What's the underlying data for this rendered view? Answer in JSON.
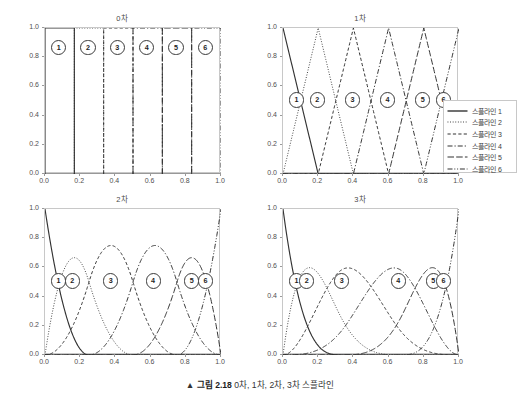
{
  "figure": {
    "caption_marker": "▲",
    "caption_label": "그림 2.18",
    "caption_text": "0차, 1차, 2차, 3차 스플라인"
  },
  "panels": [
    {
      "title": "0차",
      "degree": 0
    },
    {
      "title": "1차",
      "degree": 1
    },
    {
      "title": "2차",
      "degree": 2
    },
    {
      "title": "3차",
      "degree": 3
    }
  ],
  "axes": {
    "xticks": [
      "0.0",
      "0.2",
      "0.4",
      "0.6",
      "0.8",
      "1.0"
    ],
    "xtick_values": [
      0.0,
      0.2,
      0.4,
      0.6,
      0.8,
      1.0
    ],
    "yticks": [
      "0.0",
      "0.2",
      "0.4",
      "0.6",
      "0.8",
      "1.0"
    ],
    "ytick_values": [
      0.0,
      0.2,
      0.4,
      0.6,
      0.8,
      1.0
    ],
    "xlim": [
      0.0,
      1.0
    ],
    "ylim": [
      0.0,
      1.0
    ],
    "grid": false
  },
  "markers": [
    "1",
    "2",
    "3",
    "4",
    "5",
    "6"
  ],
  "legend": {
    "position": "right",
    "items": [
      {
        "label": "스플라인 1",
        "style": "solid"
      },
      {
        "label": "스플라인 2",
        "style": "dotted"
      },
      {
        "label": "스플라인 3",
        "style": "dashed"
      },
      {
        "label": "스플라인 4",
        "style": "dashdot"
      },
      {
        "label": "스플라인 5",
        "style": "longdash"
      },
      {
        "label": "스플라인 6",
        "style": "dashdotdot"
      }
    ]
  },
  "colors": {
    "line": "#333333",
    "axis": "#c8c8c8",
    "text": "#3a3a3a",
    "background": "#ffffff"
  },
  "chart_data": {
    "type": "line",
    "title": "0차, 1차, 2차, 3차 스플라인",
    "xlabel": "",
    "ylabel": "",
    "xlim": [
      0.0,
      1.0
    ],
    "ylim": [
      0.0,
      1.0
    ],
    "grid": false,
    "legend_position": "right",
    "subplots": [
      {
        "title": "0차",
        "degree": 0,
        "description": "Piecewise-constant (box) B-spline basis: each spline equals 1.0 on its own interval and 0.0 elsewhere.",
        "knots": [
          0.0,
          0.1667,
          0.3333,
          0.5,
          0.6667,
          0.8333,
          1.0
        ],
        "series": [
          {
            "name": "스플라인 1",
            "style": "solid",
            "support": [
              0.0,
              0.1667
            ],
            "peak_x": 0.0833,
            "peak_y": 1.0
          },
          {
            "name": "스플라인 2",
            "style": "dotted",
            "support": [
              0.1667,
              0.3333
            ],
            "peak_x": 0.25,
            "peak_y": 1.0
          },
          {
            "name": "스플라인 3",
            "style": "dashed",
            "support": [
              0.3333,
              0.5
            ],
            "peak_x": 0.4167,
            "peak_y": 1.0
          },
          {
            "name": "스플라인 4",
            "style": "dashdot",
            "support": [
              0.5,
              0.6667
            ],
            "peak_x": 0.5833,
            "peak_y": 1.0
          },
          {
            "name": "스플라인 5",
            "style": "longdash",
            "support": [
              0.6667,
              0.8333
            ],
            "peak_x": 0.75,
            "peak_y": 1.0
          },
          {
            "name": "스플라인 6",
            "style": "dashdotdot",
            "support": [
              0.8333,
              1.0
            ],
            "peak_x": 0.9167,
            "peak_y": 1.0
          }
        ],
        "marker_y": 0.86
      },
      {
        "title": "1차",
        "degree": 1,
        "description": "Piecewise-linear hat B-spline basis: each spline rises linearly to 1.0 at its node then falls back to 0.0.",
        "knots": [
          0.0,
          0.2,
          0.4,
          0.6,
          0.8,
          1.0
        ],
        "series": [
          {
            "name": "스플라인 1",
            "style": "solid",
            "support": [
              0.0,
              0.2
            ],
            "peak_x": 0.0,
            "peak_y": 1.0
          },
          {
            "name": "스플라인 2",
            "style": "dotted",
            "support": [
              0.0,
              0.4
            ],
            "peak_x": 0.2,
            "peak_y": 1.0
          },
          {
            "name": "스플라인 3",
            "style": "dashed",
            "support": [
              0.2,
              0.6
            ],
            "peak_x": 0.4,
            "peak_y": 1.0
          },
          {
            "name": "스플라인 4",
            "style": "dashdot",
            "support": [
              0.4,
              0.8
            ],
            "peak_x": 0.6,
            "peak_y": 1.0
          },
          {
            "name": "스플라인 5",
            "style": "longdash",
            "support": [
              0.6,
              1.0
            ],
            "peak_x": 0.8,
            "peak_y": 1.0
          },
          {
            "name": "스플라인 6",
            "style": "dashdotdot",
            "support": [
              0.8,
              1.0
            ],
            "peak_x": 1.0,
            "peak_y": 1.0
          }
        ],
        "marker_y": 0.5
      },
      {
        "title": "2차",
        "degree": 2,
        "description": "Quadratic B-spline basis: end splines reach 1.0 at the boundary, interior splines peak near 0.75.",
        "knots": [
          0.0,
          0.1667,
          0.3333,
          0.5,
          0.6667,
          0.8333,
          1.0
        ],
        "series": [
          {
            "name": "스플라인 1",
            "style": "solid",
            "support": [
              0.0,
              0.25
            ],
            "peak_x": 0.0,
            "peak_y": 1.0
          },
          {
            "name": "스플라인 2",
            "style": "dotted",
            "support": [
              0.0,
              0.5
            ],
            "peak_x": 0.16,
            "peak_y": 0.68
          },
          {
            "name": "스플라인 3",
            "style": "dashed",
            "support": [
              0.05,
              0.72
            ],
            "peak_x": 0.38,
            "peak_y": 0.75
          },
          {
            "name": "스플라인 4",
            "style": "dashdot",
            "support": [
              0.28,
              0.95
            ],
            "peak_x": 0.62,
            "peak_y": 0.75
          },
          {
            "name": "스플라인 5",
            "style": "longdash",
            "support": [
              0.5,
              1.0
            ],
            "peak_x": 0.84,
            "peak_y": 0.68
          },
          {
            "name": "스플라인 6",
            "style": "dashdotdot",
            "support": [
              0.75,
              1.0
            ],
            "peak_x": 1.0,
            "peak_y": 1.0
          }
        ],
        "marker_y": 0.5
      },
      {
        "title": "3차",
        "degree": 3,
        "description": "Cubic B-spline basis: end splines reach 1.0 at the boundary, interior splines peak near 0.58.",
        "knots": [
          0.0,
          0.1667,
          0.3333,
          0.5,
          0.6667,
          0.8333,
          1.0
        ],
        "series": [
          {
            "name": "스플라인 1",
            "style": "solid",
            "support": [
              0.0,
              0.33
            ],
            "peak_x": 0.0,
            "peak_y": 1.0
          },
          {
            "name": "스플라인 2",
            "style": "dotted",
            "support": [
              0.0,
              0.55
            ],
            "peak_x": 0.14,
            "peak_y": 0.6
          },
          {
            "name": "스플라인 3",
            "style": "dashed",
            "support": [
              0.0,
              0.72
            ],
            "peak_x": 0.34,
            "peak_y": 0.58
          },
          {
            "name": "스플라인 4",
            "style": "dashdot",
            "support": [
              0.28,
              1.0
            ],
            "peak_x": 0.66,
            "peak_y": 0.58
          },
          {
            "name": "스플라인 5",
            "style": "longdash",
            "support": [
              0.45,
              1.0
            ],
            "peak_x": 0.86,
            "peak_y": 0.6
          },
          {
            "name": "스플라인 6",
            "style": "dashdotdot",
            "support": [
              0.67,
              1.0
            ],
            "peak_x": 1.0,
            "peak_y": 1.0
          }
        ],
        "marker_y": 0.5
      }
    ]
  }
}
